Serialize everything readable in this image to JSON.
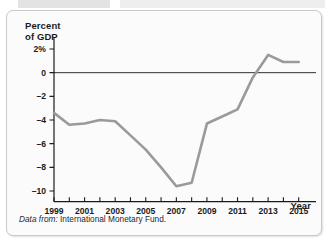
{
  "figure": {
    "background_color": "#fbfbfb",
    "border_color": "#c9c9c9",
    "line_color": "#9a9a9a",
    "axis_color": "#1b1b1b"
  },
  "labels": {
    "y_axis_line1": "Percent",
    "y_axis_line2": "of GDP",
    "x_axis": "Year",
    "source_prefix": "Data from:",
    "source_text": "International Monetary Fund."
  },
  "chart_data": {
    "type": "line",
    "title": "",
    "subtitle": "",
    "xlabel": "Year",
    "ylabel": "Percent of GDP",
    "xlim": [
      1999,
      2016
    ],
    "ylim": [
      -11,
      3
    ],
    "grid": false,
    "legend": false,
    "y_ticks": [
      2,
      0,
      -2,
      -4,
      -6,
      -8,
      -10
    ],
    "y_tick_labels": [
      "2%",
      "0",
      "–2",
      "–4",
      "–6",
      "–8",
      "–10"
    ],
    "x_ticks": [
      1999,
      2000,
      2001,
      2002,
      2003,
      2004,
      2005,
      2006,
      2007,
      2008,
      2009,
      2010,
      2011,
      2012,
      2013,
      2014,
      2015
    ],
    "x_tick_labels_shown": [
      "1999",
      "2001",
      "2003",
      "2005",
      "2007",
      "2009",
      "2011",
      "2013",
      "2015"
    ],
    "zero_line": 0,
    "series": [
      {
        "name": "Budget balance as percent of GDP",
        "x": [
          1999,
          2000,
          2001,
          2002,
          2003,
          2004,
          2005,
          2006,
          2007,
          2008,
          2009,
          2010,
          2011,
          2012,
          2013,
          2014,
          2015
        ],
        "values": [
          -3.4,
          -4.4,
          -4.3,
          -4.0,
          -4.1,
          -5.3,
          -6.5,
          -8.0,
          -9.6,
          -9.3,
          -4.3,
          -3.7,
          -3.1,
          -0.4,
          1.5,
          0.9,
          0.9
        ]
      }
    ],
    "source": "Data from: International Monetary Fund."
  }
}
